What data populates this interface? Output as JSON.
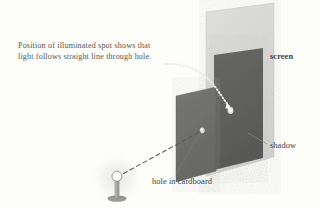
{
  "figure": {
    "background_color": "#fdfdfa",
    "caption": {
      "line1": "Position of illuminated spot shows that",
      "line2": "light follows straight line through hole."
    },
    "labels": {
      "screen": "screen",
      "shadow": "shadow",
      "hole": "hole in cardboard"
    },
    "colors": {
      "screen_panel": "#d6d6d2",
      "cardboard_panel": "#6e6e6c",
      "shadow_panel": "#5f5f5d",
      "ray_line": "#5a5a57",
      "leader_line": "#7a7a76",
      "pointer_arrow": "#f2f2ee",
      "bulb_glow": "#ededea",
      "text": "#4a4a48",
      "spot_highlight": "#f6f6f2"
    },
    "elements": {
      "light_source": "lamp with small round bulb on post and base",
      "light_ray": "dashed straight line from bulb to hole",
      "pointer": "dotted curved arrow from caption to illuminated spot",
      "illuminated_spot": "small bright spot on screen inside shadow",
      "hole": "small bright opening in cardboard panel"
    }
  }
}
